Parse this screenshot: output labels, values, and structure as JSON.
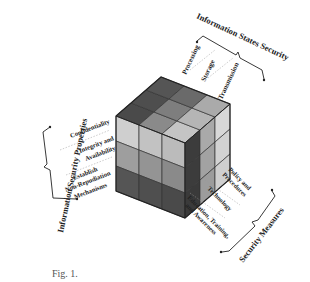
{
  "diagram": {
    "title_top": "Information States Security",
    "title_left": "Information Security Properties",
    "title_bottom": "Security Measures",
    "states": [
      "Processing",
      "Storage",
      "Transmission"
    ],
    "properties": [
      "Confidentiality",
      "Integrity and",
      "Availability",
      "Establish",
      "Non-Repudiation",
      "Mechanisms"
    ],
    "measures": [
      "Policy and",
      "Procedures",
      "Technology",
      "Education, Training,",
      "and Awareness"
    ],
    "caption": "Fig. 1.",
    "colors": {
      "top_dark": "#4a4a4a",
      "top_mid": "#8a8a8a",
      "top_light": "#bdbdbd",
      "front_light": "#c8c8c8",
      "front_mid": "#9a9a9a",
      "front_dark": "#555555",
      "side_dark": "#3c3c3c",
      "side_mid": "#a8a8a8",
      "side_light": "#d6d6d6",
      "line": "#333333"
    }
  }
}
